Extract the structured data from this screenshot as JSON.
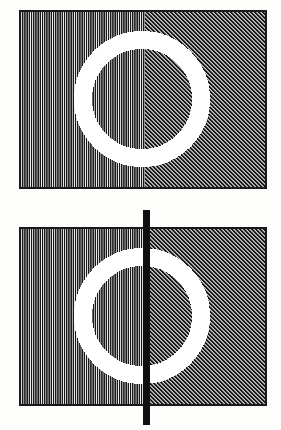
{
  "figure": {
    "background_color": "#fdfdfc",
    "ink_color": "#1a1a1a",
    "ring_color": "#ffffff",
    "panels": [
      {
        "name": "panel-upper",
        "label": "upper-stimulus-no-occluder",
        "rect": {
          "x": 20,
          "y": 11,
          "width": 246,
          "height": 177
        },
        "border_color": "#1a1a1a",
        "border_width": 2,
        "texture_boundary_x": 145,
        "left_texture": {
          "name": "vertical-line-grating",
          "orientation_deg": 90,
          "period_px": 2.2,
          "line_width_px": 1.1,
          "color": "#1a1a1a"
        },
        "right_texture": {
          "name": "diagonal-hatch-grating",
          "orientation_deg": 45,
          "period_px": 2.0,
          "line_width_px": 1.0,
          "color": "#1a1a1a"
        },
        "ring": {
          "name": "white-annulus",
          "center_x": 142,
          "center_y": 99,
          "outer_radius": 68,
          "inner_radius": 50,
          "stroke_width": 18,
          "color": "#ffffff"
        },
        "occluder": null
      },
      {
        "name": "panel-lower",
        "label": "lower-stimulus-with-occluder",
        "rect": {
          "x": 20,
          "y": 228,
          "width": 246,
          "height": 177
        },
        "border_color": "#1a1a1a",
        "border_width": 2,
        "texture_boundary_x": 145,
        "left_texture": {
          "name": "vertical-line-grating",
          "orientation_deg": 90,
          "period_px": 2.2,
          "line_width_px": 1.1,
          "color": "#1a1a1a"
        },
        "right_texture": {
          "name": "diagonal-hatch-grating",
          "orientation_deg": 45,
          "period_px": 2.0,
          "line_width_px": 1.0,
          "color": "#1a1a1a"
        },
        "ring": {
          "name": "white-annulus",
          "center_x": 142,
          "center_y": 316,
          "outer_radius": 68,
          "inner_radius": 50,
          "stroke_width": 18,
          "color": "#ffffff"
        },
        "occluder": {
          "name": "vertical-black-bar",
          "x": 143,
          "y": 210,
          "width": 7,
          "height": 215,
          "color": "#101010"
        }
      }
    ]
  }
}
